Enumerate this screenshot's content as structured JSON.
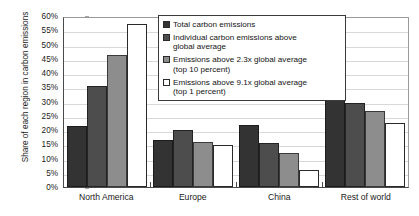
{
  "chart_data": {
    "type": "bar",
    "title": "",
    "xlabel": "",
    "ylabel": "Share of each region in carbon emissions",
    "ylim": [
      0,
      60
    ],
    "ytick_labels": [
      "60%",
      "55%",
      "50%",
      "45%",
      "40%",
      "35%",
      "30%",
      "25%",
      "20%",
      "15%",
      "10%",
      "5%",
      "0%"
    ],
    "ytick_values": [
      60,
      55,
      50,
      45,
      40,
      35,
      30,
      25,
      20,
      15,
      10,
      5,
      0
    ],
    "grid": true,
    "legend_position": "top-center",
    "categories": [
      "North America",
      "Europe",
      "China",
      "Rest of world"
    ],
    "series": [
      {
        "name": "Total carbon emissions",
        "color": "#333333",
        "values": [
          21.3,
          16.5,
          21.8,
          41.0
        ]
      },
      {
        "name": "Individual carbon emissions above global average",
        "color": "#4d4d4d",
        "values": [
          35.5,
          20.1,
          15.3,
          29.4
        ]
      },
      {
        "name": "Emissions above 2.3x global average (top 10 percent)",
        "color": "#8d8d8d",
        "values": [
          46.2,
          15.7,
          11.9,
          26.8
        ]
      },
      {
        "name": "Emissions above 9.1x global average (top 1 percent)",
        "color": "#ffffff",
        "values": [
          57.2,
          14.9,
          5.8,
          22.4
        ]
      }
    ]
  },
  "legend": {
    "items": [
      {
        "line1": "Total carbon emissions",
        "line2": ""
      },
      {
        "line1": "Individual carbon emissions above",
        "line2": "global average"
      },
      {
        "line1": "Emissions above 2.3x global average",
        "line2": "(top 10 percent)"
      },
      {
        "line1": "Emissions above 9.1x global average",
        "line2": "(top 1 percent)"
      }
    ]
  }
}
